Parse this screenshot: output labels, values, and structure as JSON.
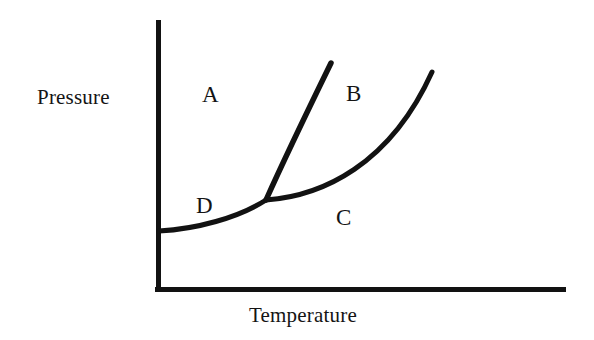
{
  "figure": {
    "name": "pressure-temperature-phase-diagram",
    "background_color": "#ffffff",
    "line_color": "#121212"
  },
  "axes": {
    "y_title": "Pressure",
    "x_title": "Temperature",
    "y_axis": {
      "x": 158,
      "y_top": 20,
      "y_bottom": 291,
      "thickness": 5
    },
    "x_axis": {
      "y": 289,
      "x_left": 155,
      "x_right": 566,
      "thickness": 5
    },
    "grid": false,
    "tick_labels_x": [],
    "tick_labels_y": []
  },
  "regions": [
    {
      "id": "A",
      "label": "A",
      "x": 208,
      "y": 95
    },
    {
      "id": "B",
      "label": "B",
      "x": 353,
      "y": 94
    },
    {
      "id": "C",
      "label": "C",
      "x": 344,
      "y": 218
    },
    {
      "id": "D",
      "label": "D",
      "x": 204,
      "y": 206
    }
  ],
  "chart_data": {
    "type": "line",
    "title": "",
    "xlabel": "Temperature",
    "ylabel": "Pressure",
    "xlim": [
      155,
      566
    ],
    "ylim": [
      20,
      289
    ],
    "grid": false,
    "legend": "none",
    "annotations": [
      {
        "text": "A",
        "x": 208,
        "y": 95
      },
      {
        "text": "B",
        "x": 353,
        "y": 94
      },
      {
        "text": "C",
        "x": 344,
        "y": 218
      },
      {
        "text": "D",
        "x": 204,
        "y": 206
      }
    ],
    "points_of_interest": [
      {
        "name": "triple-point",
        "x": 266,
        "y": 200
      },
      {
        "name": "critical-point",
        "x": 432,
        "y": 72
      },
      {
        "name": "sublimation-origin",
        "x": 159,
        "y": 231
      },
      {
        "name": "fusion-end",
        "x": 331,
        "y": 63
      }
    ],
    "series": [
      {
        "name": "sublimation-curve",
        "path": "M 159 231 C 196 229 238 218 266 200",
        "x": [
          159,
          180,
          205,
          232,
          250,
          266
        ],
        "y": [
          231,
          230,
          225,
          217,
          209,
          200
        ]
      },
      {
        "name": "fusion-curve",
        "path": "M 266 200 C 283 162 309 108 331 63",
        "x": [
          266,
          285,
          300,
          315,
          331
        ],
        "y": [
          200,
          160,
          127,
          95,
          63
        ]
      },
      {
        "name": "vaporization-curve",
        "path": "M 266 200 C 322 196 390 165 432 72",
        "x": [
          266,
          300,
          340,
          380,
          410,
          432
        ],
        "y": [
          200,
          194,
          180,
          153,
          118,
          72
        ]
      }
    ]
  }
}
